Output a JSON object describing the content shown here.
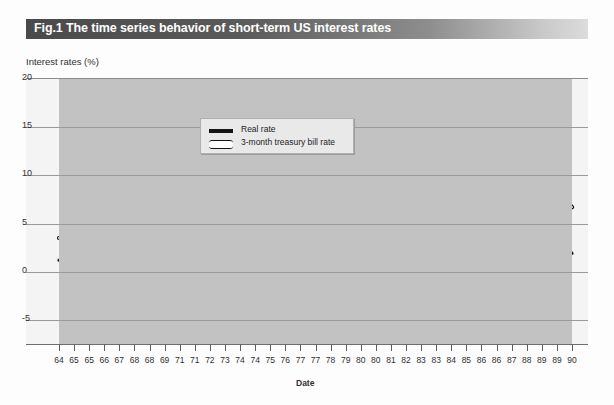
{
  "title": "Fig.1 The time series behavior of short-term US interest rates",
  "axis": {
    "ylabel": "Interest rates (%)",
    "xlabel": "Date"
  },
  "legend": {
    "items": [
      {
        "label": "Real rate",
        "style": "solid-thick",
        "color": "#151515"
      },
      {
        "label": "3-month treasury bill rate",
        "style": "hollow-outline",
        "color": "#151515"
      }
    ]
  },
  "colors": {
    "plot_background": "#c2c2c2",
    "frame_background": "#f4f4f4",
    "gridline": "#9a9a9a",
    "title_band_dark": "#4a4a4a",
    "title_band_light": "#dcdcdc",
    "series_real": "#151515",
    "series_tbill": "#151515"
  },
  "chart_data": {
    "type": "line",
    "title": "Fig.1 The time series behavior of short-term US interest rates",
    "xlabel": "Date",
    "ylabel": "Interest rates (%)",
    "ylim": [
      -7.5,
      20
    ],
    "yticks": [
      20,
      15,
      10,
      5,
      0,
      -5
    ],
    "ytick_labels": [
      "20",
      "15",
      "10",
      "5",
      "0",
      "-5"
    ],
    "grid": true,
    "legend_position": "upper-left-inside",
    "xtick_labels": [
      "64",
      "65",
      "65",
      "66",
      "67",
      "68",
      "68",
      "69",
      "71",
      "71",
      "72",
      "73",
      "74",
      "74",
      "75",
      "76",
      "77",
      "77",
      "78",
      "79",
      "80",
      "80",
      "81",
      "82",
      "83",
      "83",
      "84",
      "85",
      "86",
      "86",
      "87",
      "88",
      "89",
      "89",
      "90"
    ],
    "x_start": 1964.0,
    "x_end": 1990.5,
    "x_step_quarters": 0.25,
    "series": [
      {
        "name": "3-month treasury bill rate",
        "values": [
          3.5,
          3.5,
          3.5,
          3.6,
          3.8,
          3.9,
          3.9,
          4.0,
          4.4,
          4.6,
          4.6,
          4.4,
          4.6,
          4.8,
          5.1,
          5.3,
          4.9,
          4.5,
          4.3,
          4.4,
          4.6,
          5.0,
          5.2,
          5.4,
          5.3,
          5.5,
          5.9,
          6.1,
          6.3,
          6.5,
          7.1,
          7.4,
          7.2,
          6.7,
          6.4,
          5.4,
          4.0,
          3.9,
          4.6,
          4.4,
          3.8,
          3.7,
          4.2,
          4.8,
          5.1,
          5.7,
          6.5,
          7.3,
          7.8,
          8.3,
          8.0,
          7.4,
          6.0,
          5.3,
          5.6,
          5.5,
          5.0,
          5.2,
          5.4,
          5.5,
          4.9,
          5.1,
          5.3,
          5.8,
          6.3,
          6.8,
          7.3,
          7.7,
          8.1,
          8.7,
          9.3,
          9.9,
          10.0,
          9.6,
          10.2,
          11.6,
          14.0,
          15.2,
          12.0,
          7.8,
          9.1,
          13.8,
          14.2,
          14.8,
          13.3,
          14.6,
          12.8,
          12.5,
          13.0,
          11.8,
          11.9,
          8.0,
          7.8,
          8.3,
          8.5,
          8.5,
          9.0,
          9.3,
          9.6,
          9.4,
          9.9,
          9.2,
          8.6,
          8.4,
          8.0,
          7.5,
          7.1,
          7.0,
          6.6,
          6.2,
          6.4,
          6.9,
          7.1,
          7.4,
          7.8,
          8.0,
          8.2,
          8.0,
          7.9,
          7.6,
          7.2,
          6.7
        ]
      },
      {
        "name": "Real rate",
        "values": [
          1.2,
          1.3,
          1.2,
          1.2,
          1.2,
          1.0,
          1.0,
          1.1,
          1.3,
          1.1,
          0.7,
          0.9,
          1.0,
          2.3,
          1.6,
          0.5,
          1.8,
          1.2,
          0.5,
          0.4,
          0.4,
          0.3,
          0.4,
          0.7,
          0.6,
          0.8,
          0.9,
          0.8,
          0.6,
          1.0,
          2.5,
          1.5,
          2.9,
          1.5,
          1.1,
          0.8,
          0.3,
          0.8,
          1.4,
          1.0,
          0.9,
          0.6,
          -0.3,
          -1.1,
          -1.0,
          -1.4,
          -1.0,
          -0.3,
          -1.2,
          -3.2,
          -5.0,
          -5.6,
          -3.6,
          -2.0,
          -2.9,
          -1.2,
          -1.4,
          -0.8,
          -1.4,
          -0.3,
          -1.1,
          -0.5,
          -0.2,
          -0.7,
          0.4,
          0.9,
          2.3,
          1.5,
          1.3,
          2.0,
          2.3,
          2.1,
          1.0,
          0.3,
          0.8,
          1.2,
          3.0,
          7.0,
          -0.8,
          2.1,
          4.2,
          3.3,
          5.2,
          4.0,
          2.5,
          5.2,
          4.0,
          4.6,
          3.0,
          3.6,
          2.0,
          3.8,
          5.5,
          4.6,
          4.4,
          4.0,
          4.6,
          3.7,
          3.6,
          3.2,
          4.6,
          3.2,
          2.5,
          2.3,
          2.2,
          2.6,
          2.5,
          2.1,
          2.9,
          2.6,
          2.7,
          3.4,
          3.9,
          3.6,
          3.2,
          3.4,
          3.6,
          3.2,
          3.4,
          3.0,
          2.9,
          2.4,
          1.9
        ]
      }
    ]
  }
}
